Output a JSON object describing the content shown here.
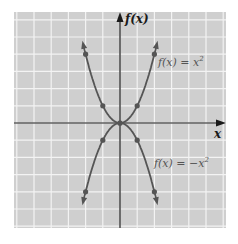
{
  "chart_data": {
    "type": "line",
    "title": "",
    "xlabel": "x",
    "ylabel": "f(x)",
    "xlim": [
      -6,
      6
    ],
    "ylim": [
      -6,
      6.5
    ],
    "grid": true,
    "series": [
      {
        "name": "f(x) = x^2",
        "label": "f(x) = x",
        "sup": "2",
        "points": [
          [
            -2,
            4
          ],
          [
            -1,
            1
          ],
          [
            0,
            0
          ],
          [
            1,
            1
          ],
          [
            2,
            4
          ]
        ]
      },
      {
        "name": "f(x) = -x^2",
        "label": "f(x) = −x",
        "sup": "2",
        "points": [
          [
            -2,
            -4
          ],
          [
            -1,
            -1
          ],
          [
            0,
            0
          ],
          [
            1,
            -1
          ],
          [
            2,
            -4
          ]
        ]
      }
    ],
    "colors": {
      "panel": "#cfcfcf",
      "grid": "#f2f2f2",
      "curve": "#555555",
      "axis": "#1a1a1a"
    }
  },
  "axes": {
    "x_label": "x",
    "y_label": "f(x)"
  },
  "labels": {
    "upper": {
      "text": "f(x) = x",
      "sup": "2"
    },
    "lower": {
      "text": "f(x) = −x",
      "sup": "2"
    }
  }
}
